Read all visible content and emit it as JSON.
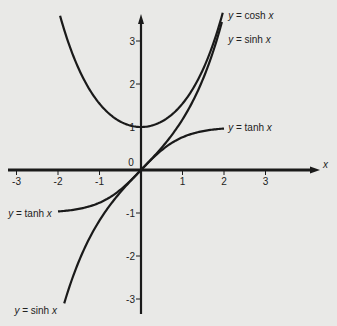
{
  "chart_data": {
    "type": "line",
    "title": "",
    "xlabel": "x",
    "ylabel": "",
    "xlim": [
      -3.2,
      4.2
    ],
    "ylim": [
      -3.4,
      3.6
    ],
    "grid": false,
    "x_ticks": [
      -3,
      -2,
      -1,
      1,
      2,
      3
    ],
    "y_ticks": [
      -3,
      -2,
      -1,
      1,
      2,
      3
    ],
    "origin_label": "0",
    "series": [
      {
        "name": "y = cosh x",
        "function": "cosh",
        "x_range": [
          -1.95,
          1.97
        ],
        "labels": [
          {
            "text_pre": "y = cosh ",
            "text_var": "x",
            "at": [
              2.1,
              3.6
            ]
          }
        ]
      },
      {
        "name": "y = sinh x",
        "function": "sinh",
        "x_range": [
          -1.85,
          1.95
        ],
        "labels": [
          {
            "text_pre": "y = sinh ",
            "text_var": "x",
            "at": [
              2.1,
              3.05
            ]
          },
          {
            "text_pre": "y = sinh ",
            "text_var": "x",
            "at": [
              -3.05,
              -3.25
            ]
          }
        ]
      },
      {
        "name": "y = tanh x",
        "function": "tanh",
        "x_range": [
          -2,
          2
        ],
        "labels": [
          {
            "text_pre": "y = tanh ",
            "text_var": "x",
            "at": [
              2.1,
              1.0
            ]
          },
          {
            "text_pre": "y = tanh ",
            "text_var": "x",
            "at": [
              -3.2,
              -1.0
            ]
          }
        ]
      }
    ]
  },
  "colors": {
    "background": "#e9e9e7",
    "ink": "#1a1a1a"
  }
}
